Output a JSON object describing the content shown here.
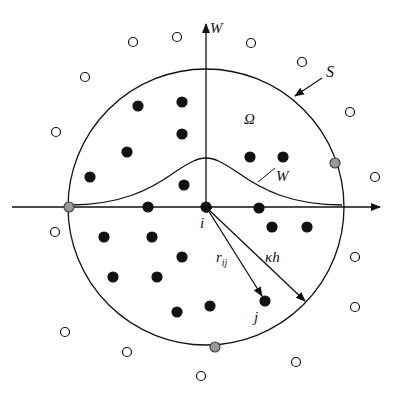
{
  "diagram": {
    "labels": {
      "vertical_axis": "W",
      "support_boundary": "S",
      "domain": "Ω",
      "kernel_curve": "W",
      "particle_i": "i",
      "particle_j": "j",
      "distance_rij": "r",
      "distance_rij_sub": "ij",
      "smoothing_radius": "κh"
    },
    "center": {
      "x": 206,
      "y": 207
    },
    "support_radius": 138,
    "colors": {
      "line": "#111111",
      "inner_particle": "#111111",
      "outer_particle_fill": "#ffffff",
      "boundary_particle": "#999999"
    },
    "inner_particles": [
      [
        138,
        106
      ],
      [
        182,
        102
      ],
      [
        127,
        152
      ],
      [
        182,
        134
      ],
      [
        90,
        177
      ],
      [
        184,
        185
      ],
      [
        250,
        157
      ],
      [
        283,
        157
      ],
      [
        148,
        207
      ],
      [
        259,
        208
      ],
      [
        272,
        227
      ],
      [
        307,
        227
      ],
      [
        104,
        237
      ],
      [
        152,
        237
      ],
      [
        182,
        257
      ],
      [
        113,
        277
      ],
      [
        157,
        277
      ],
      [
        177,
        312
      ],
      [
        210,
        306
      ],
      [
        265,
        301
      ],
      [
        206,
        207
      ]
    ],
    "outer_particles": [
      [
        133,
        42
      ],
      [
        177,
        37
      ],
      [
        251,
        43
      ],
      [
        302,
        62
      ],
      [
        350,
        112
      ],
      [
        85,
        77
      ],
      [
        375,
        177
      ],
      [
        56,
        132
      ],
      [
        55,
        232
      ],
      [
        355,
        257
      ],
      [
        355,
        307
      ],
      [
        65,
        332
      ],
      [
        127,
        352
      ],
      [
        296,
        362
      ],
      [
        201,
        376
      ]
    ],
    "boundary_particles": [
      [
        69,
        207
      ],
      [
        335,
        163
      ],
      [
        215,
        347
      ]
    ]
  }
}
